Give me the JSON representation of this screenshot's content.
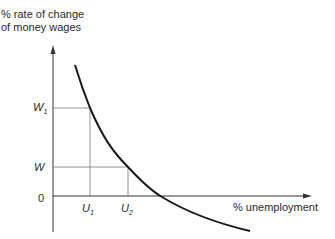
{
  "diagram": {
    "y_axis_label_line1": "% rate of change",
    "y_axis_label_line2": "of money wages",
    "x_axis_label": "% unemployment",
    "origin_label": "0",
    "y_ticks": [
      {
        "main": "W",
        "sub": "1"
      },
      {
        "main": "W",
        "sub": ""
      }
    ],
    "x_ticks": [
      {
        "main": "U",
        "sub": "1"
      },
      {
        "main": "U",
        "sub": "2"
      }
    ],
    "colors": {
      "line": "#1a1a1a",
      "guide": "#6a6a6a",
      "text": "#2a2a2a"
    }
  }
}
